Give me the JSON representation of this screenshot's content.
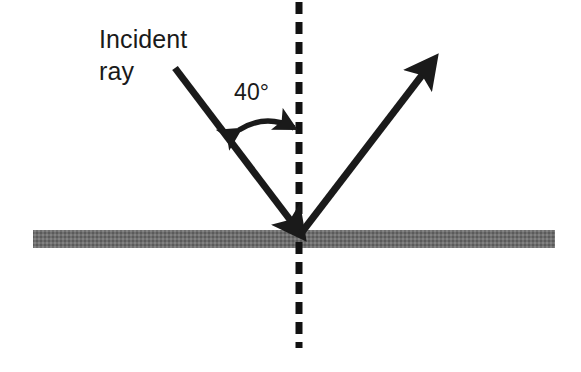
{
  "diagram": {
    "title_text": "",
    "labels": {
      "incident_ray": "Incident\nray",
      "angle": "40°"
    },
    "colors": {
      "ray_stroke": "#1a1a1a",
      "normal_line": "#111111",
      "mirror_surface": "#6e6e6e",
      "mirror_surface_dark": "#4f4f4f",
      "text": "#1a1a1a",
      "background": "#ffffff"
    },
    "elements": {
      "incident_ray_name": "incident-ray-arrow",
      "reflected_ray_name": "reflected-ray-arrow",
      "normal_name": "normal-dashed-line",
      "mirror_name": "mirror-surface-bar",
      "angle_arc_name": "angle-arc-double-arrow"
    },
    "geometry": {
      "incidence_angle_degrees": 40,
      "incident_ray_start": [
        175,
        68
      ],
      "incident_ray_end": [
        299,
        232
      ],
      "reflected_ray_start": [
        302,
        232
      ],
      "reflected_ray_end": [
        432,
        62
      ],
      "normal_x": 299,
      "normal_top": 2,
      "normal_bottom": 348,
      "mirror_left": 33,
      "mirror_right": 555,
      "mirror_top": 230,
      "mirror_bottom": 248
    }
  }
}
